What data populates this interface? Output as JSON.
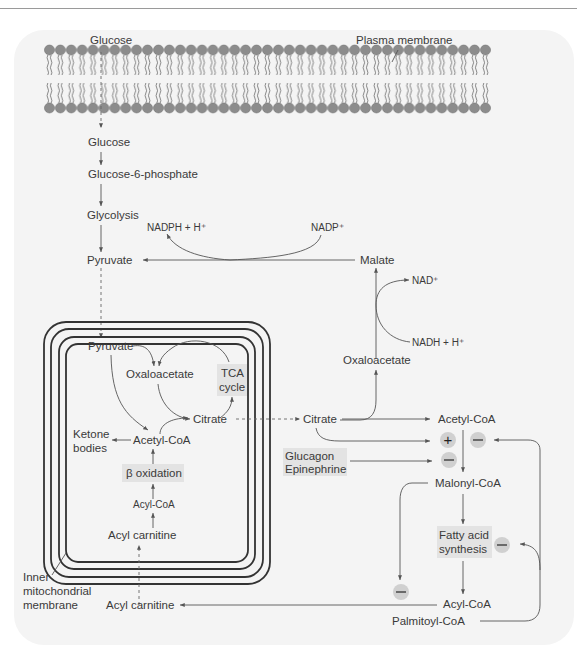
{
  "diagram": {
    "labels": {
      "glucose_outside": "Glucose",
      "plasma_membrane": "Plasma membrane",
      "glucose": "Glucose",
      "glucose6p": "Glucose-6-phosphate",
      "glycolysis": "Glycolysis",
      "nadph": "NADPH + H⁺",
      "nadp": "NADP⁺",
      "pyruvate_cyto": "Pyruvate",
      "malate": "Malate",
      "nad": "NAD⁺",
      "nadh": "NADH + H⁺",
      "oxaloacetate_cyto": "Oxaloacetate",
      "pyruvate_mito": "Pyruvate",
      "oxaloacetate_mito": "Oxaloacetate",
      "tca_line1": "TCA",
      "tca_line2": "cycle",
      "citrate_mito": "Citrate",
      "ketone_line1": "Ketone",
      "ketone_line2": "bodies",
      "acetylcoa_mito": "Acetyl-CoA",
      "beta_oxidation": "β oxidation",
      "acylcoa_mito": "Acyl-CoA",
      "acylcarnitine_mito": "Acyl carnitine",
      "citrate_cyto": "Citrate",
      "acetylcoa_cyto": "Acetyl-CoA",
      "glucagon": "Glucagon",
      "epinephrine": "Epinephrine",
      "malonylcoa": "Malonyl-CoA",
      "fas_line1": "Fatty acid",
      "fas_line2": "synthesis",
      "inner_line1": "Inner",
      "inner_line2": "mitochondrial",
      "inner_line3": "membrane",
      "acylcarnitine_cyto": "Acyl carnitine",
      "acylcoa_cyto": "Acyl-CoA",
      "palmitoylcoa": "Palmitoyl-CoA"
    },
    "regulators": {
      "citrate_activates": "+",
      "palmitoyl_inhibits_acc": "−",
      "glucagon_inhibits": "−",
      "palmitoyl_inhibits_fas": "−",
      "malonyl_inhibits_cpt": "−"
    },
    "colors": {
      "text": "#3a3a3a",
      "line": "#555555",
      "membrane_head": "#8c8c8c",
      "highlight_box": "#e3e3e3",
      "regulator_circle": "#d0d0d0",
      "background": "#f4f4f4"
    }
  }
}
